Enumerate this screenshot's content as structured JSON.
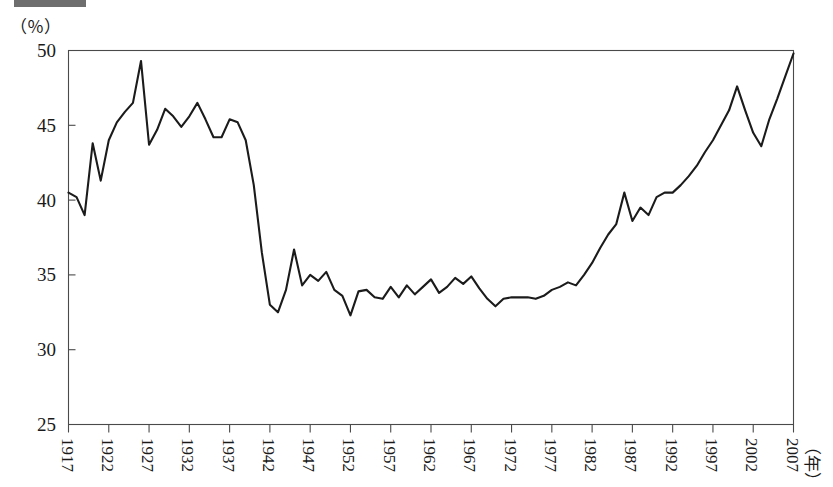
{
  "figure": {
    "unit_label": "（％）",
    "x_axis_unit": "（年）",
    "title_bar_fragment": "redacted-title-bar"
  },
  "chart_data": {
    "type": "line",
    "title": "",
    "subtitle": "",
    "xlabel": "（年）",
    "ylabel": "（％）",
    "xlim": [
      1917,
      2007
    ],
    "ylim": [
      25,
      50
    ],
    "grid": false,
    "legend": "none",
    "y_ticks": [
      25,
      30,
      35,
      40,
      45,
      50
    ],
    "y_tick_labels": [
      "25",
      "30",
      "35",
      "40",
      "45",
      "50"
    ],
    "x_ticks": [
      1917,
      1922,
      1927,
      1932,
      1937,
      1942,
      1947,
      1952,
      1957,
      1962,
      1967,
      1972,
      1977,
      1982,
      1987,
      1992,
      1997,
      2002,
      2007
    ],
    "x_tick_labels": [
      "1917",
      "1922",
      "1927",
      "1932",
      "1937",
      "1942",
      "1947",
      "1952",
      "1957",
      "1962",
      "1967",
      "1972",
      "1977",
      "1982",
      "1987",
      "1992",
      "1997",
      "2002",
      "2007"
    ],
    "series": [
      {
        "name": "share",
        "x": [
          1917,
          1918,
          1919,
          1920,
          1921,
          1922,
          1923,
          1924,
          1925,
          1926,
          1927,
          1928,
          1929,
          1930,
          1931,
          1932,
          1933,
          1934,
          1935,
          1936,
          1937,
          1938,
          1939,
          1940,
          1941,
          1942,
          1943,
          1944,
          1945,
          1946,
          1947,
          1948,
          1949,
          1950,
          1951,
          1952,
          1953,
          1954,
          1955,
          1956,
          1957,
          1958,
          1959,
          1960,
          1961,
          1962,
          1963,
          1964,
          1965,
          1966,
          1967,
          1968,
          1969,
          1970,
          1971,
          1972,
          1973,
          1974,
          1975,
          1976,
          1977,
          1978,
          1979,
          1980,
          1981,
          1982,
          1983,
          1984,
          1985,
          1986,
          1987,
          1988,
          1989,
          1990,
          1991,
          1992,
          1993,
          1994,
          1995,
          1996,
          1997,
          1998,
          1999,
          2000,
          2001,
          2002,
          2003,
          2004,
          2005,
          2006,
          2007
        ],
        "y": [
          40.5,
          40.2,
          39.0,
          43.8,
          41.3,
          44.0,
          45.2,
          45.9,
          46.5,
          49.3,
          43.7,
          44.7,
          46.1,
          45.6,
          44.9,
          45.6,
          46.5,
          45.4,
          44.2,
          44.2,
          45.4,
          45.2,
          44.0,
          41.0,
          36.5,
          33.0,
          32.5,
          34.0,
          36.7,
          34.3,
          35.0,
          34.6,
          35.2,
          34.0,
          33.6,
          32.3,
          33.9,
          34.0,
          33.5,
          33.4,
          34.2,
          33.5,
          34.3,
          33.7,
          34.2,
          34.7,
          33.8,
          34.2,
          34.8,
          34.4,
          34.9,
          34.1,
          33.4,
          32.9,
          33.4,
          33.5,
          33.5,
          33.5,
          33.4,
          33.6,
          34.0,
          34.2,
          34.5,
          34.3,
          35.0,
          35.8,
          36.8,
          37.7,
          38.4,
          40.5,
          38.6,
          39.5,
          39.0,
          40.2,
          40.5,
          40.5,
          41.0,
          41.6,
          42.3,
          43.2,
          44.0,
          45.0,
          46.0,
          47.6,
          46.0,
          44.5,
          43.6,
          45.4,
          46.8,
          48.3,
          49.8
        ]
      }
    ]
  }
}
